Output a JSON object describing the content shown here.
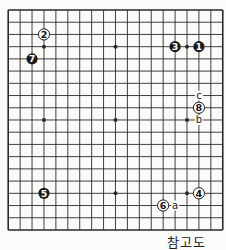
{
  "diagram": {
    "type": "go-board",
    "size": 19,
    "colors": {
      "background": "#fbfbf9",
      "line": "#2a2a2a",
      "black_stone": "#1a1a1a",
      "white_stone": "#ffffff"
    },
    "star_points": [
      [
        3,
        3
      ],
      [
        9,
        3
      ],
      [
        15,
        3
      ],
      [
        3,
        9
      ],
      [
        9,
        9
      ],
      [
        15,
        9
      ],
      [
        3,
        15
      ],
      [
        9,
        15
      ],
      [
        15,
        15
      ]
    ],
    "stones": [
      {
        "number": "1",
        "color": "black",
        "col": 16,
        "row": 3
      },
      {
        "number": "2",
        "color": "white",
        "col": 3,
        "row": 2
      },
      {
        "number": "3",
        "color": "black",
        "col": 14,
        "row": 3
      },
      {
        "number": "4",
        "color": "white",
        "col": 16,
        "row": 15
      },
      {
        "number": "5",
        "color": "black",
        "col": 3,
        "row": 15
      },
      {
        "number": "6",
        "color": "white",
        "col": 13,
        "row": 16
      },
      {
        "number": "7",
        "color": "black",
        "col": 2,
        "row": 4
      },
      {
        "number": "8",
        "color": "white",
        "col": 16,
        "row": 8
      }
    ],
    "labels": [
      {
        "text": "a",
        "col": 14,
        "row": 16
      },
      {
        "text": "b",
        "col": 16,
        "row": 9
      },
      {
        "text": "c",
        "col": 16,
        "row": 7
      }
    ]
  },
  "caption": "참고도"
}
